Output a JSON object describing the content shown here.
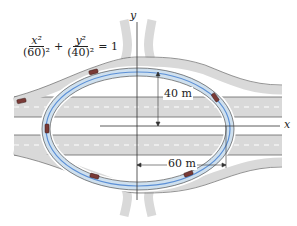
{
  "diagram": {
    "equation": {
      "term1_num": "x²",
      "term1_den": "(60)²",
      "plus": "+",
      "term2_num": "y²",
      "term2_den": "(40)²",
      "equals": "= 1"
    },
    "axes": {
      "x_label": "x",
      "y_label": "y"
    },
    "dimensions": {
      "semi_minor": "40 m",
      "semi_major": "60 m"
    },
    "colors": {
      "road": "#d9d9d9",
      "road_edge": "#555555",
      "ellipse_path": "#5b8fd6",
      "ramp_fill": "#cfe0ee",
      "car": "#7a3a36"
    }
  }
}
